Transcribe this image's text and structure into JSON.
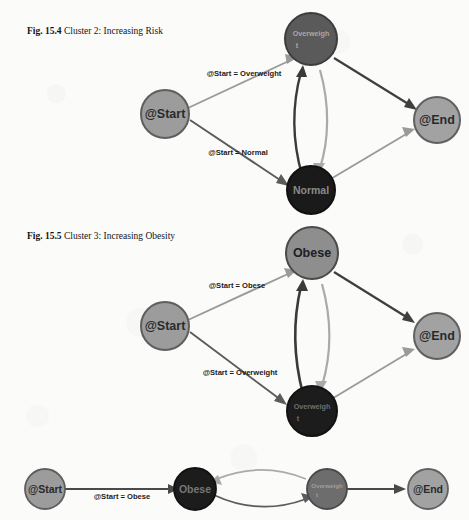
{
  "page": {
    "background_color": "#fbfbfa",
    "text_color": "#141414"
  },
  "figures": [
    {
      "id": "fig-15-4",
      "number": "Fig. 15.4",
      "caption": "Cluster 2: Increasing Risk",
      "caption_line1": "Cluster 2:",
      "caption_line2": "Increasing Risk",
      "nodes": [
        {
          "id": "start",
          "label": "@Start",
          "fill": "#9c9c9c",
          "stroke": "#5e5e5e",
          "text_color": "#2a2a2a",
          "r": 24,
          "font_size": 12.5
        },
        {
          "id": "overweight",
          "label": "Overweight",
          "fill": "#5a5a5a",
          "stroke": "#3d3d3d",
          "text_color": "#a8a8a8",
          "r": 26,
          "font_size": 7.2
        },
        {
          "id": "normal",
          "label": "Normal",
          "fill": "#1a1a1a",
          "stroke": "#101010",
          "text_color": "#8a8a8a",
          "r": 24,
          "font_size": 10.5
        },
        {
          "id": "end",
          "label": "@End",
          "fill": "#a2a2a2",
          "stroke": "#606060",
          "text_color": "#2a2a2a",
          "r": 23,
          "font_size": 12.5
        }
      ],
      "edges": [
        {
          "from": "start",
          "to": "overweight",
          "label": "@Start = Overweight",
          "color": "#9a9a9a"
        },
        {
          "from": "start",
          "to": "normal",
          "label": "@Start = Normal",
          "color": "#5b5b5b"
        },
        {
          "from": "normal",
          "to": "overweight",
          "label": "",
          "color": "#3a3a3a"
        },
        {
          "from": "overweight",
          "to": "normal",
          "label": "",
          "color": "#aaaaaa"
        },
        {
          "from": "overweight",
          "to": "end",
          "label": "",
          "color": "#3f3f3f"
        },
        {
          "from": "normal",
          "to": "end",
          "label": "",
          "color": "#9a9a9a"
        }
      ]
    },
    {
      "id": "fig-15-5",
      "number": "Fig. 15.5",
      "caption": "Cluster 3: Increasing Obesity",
      "caption_line1": "Cluster 3:",
      "caption_line2": "Increasing Obesity",
      "nodes": [
        {
          "id": "start",
          "label": "@Start",
          "fill": "#9c9c9c",
          "stroke": "#5e5e5e",
          "text_color": "#2a2a2a",
          "r": 24,
          "font_size": 12.5
        },
        {
          "id": "obese",
          "label": "Obese",
          "fill": "#8e8e8e",
          "stroke": "#4a4a4a",
          "text_color": "#202020",
          "r": 26,
          "font_size": 12.5
        },
        {
          "id": "overweight",
          "label": "Overweight",
          "fill": "#1c1c1c",
          "stroke": "#121212",
          "text_color": "#6f6f6f",
          "r": 25,
          "font_size": 7.2
        },
        {
          "id": "end",
          "label": "@End",
          "fill": "#a2a2a2",
          "stroke": "#606060",
          "text_color": "#2a2a2a",
          "r": 23,
          "font_size": 12.5
        }
      ],
      "edges": [
        {
          "from": "start",
          "to": "obese",
          "label": "@Start = Obese",
          "color": "#9a9a9a"
        },
        {
          "from": "start",
          "to": "overweight",
          "label": "@Start = Overweight",
          "color": "#5b5b5b"
        },
        {
          "from": "overweight",
          "to": "obese",
          "label": "",
          "color": "#3a3a3a"
        },
        {
          "from": "obese",
          "to": "overweight",
          "label": "",
          "color": "#aaaaaa"
        },
        {
          "from": "obese",
          "to": "end",
          "label": "",
          "color": "#3f3f3f"
        },
        {
          "from": "overweight",
          "to": "end",
          "label": "",
          "color": "#9a9a9a"
        }
      ]
    },
    {
      "id": "fig-bottom",
      "number": "",
      "caption": "",
      "caption_line1": "",
      "caption_line2": "",
      "nodes": [
        {
          "id": "start",
          "label": "@Start",
          "fill": "#9c9c9c",
          "stroke": "#5e5e5e",
          "text_color": "#2a2a2a",
          "r": 20,
          "font_size": 10.5
        },
        {
          "id": "obese",
          "label": "Obese",
          "fill": "#1c1c1c",
          "stroke": "#111111",
          "text_color": "#767676",
          "r": 21,
          "font_size": 10.5
        },
        {
          "id": "overweight",
          "label": "Overweight",
          "fill": "#6d6d6d",
          "stroke": "#4a4a4a",
          "text_color": "#9e9e9e",
          "r": 20,
          "font_size": 6.2
        },
        {
          "id": "end",
          "label": "@End",
          "fill": "#a2a2a2",
          "stroke": "#606060",
          "text_color": "#2a2a2a",
          "r": 20,
          "font_size": 10.5
        }
      ],
      "edges": [
        {
          "from": "start",
          "to": "obese",
          "label": "@Start = Obese",
          "color": "#4a4a4a"
        },
        {
          "from": "obese",
          "to": "overweight",
          "label": "",
          "color": "#5b5b5b"
        },
        {
          "from": "overweight",
          "to": "obese",
          "label": "",
          "color": "#aaaaaa"
        },
        {
          "from": "overweight",
          "to": "end",
          "label": "",
          "color": "#4a4a4a"
        }
      ]
    }
  ]
}
